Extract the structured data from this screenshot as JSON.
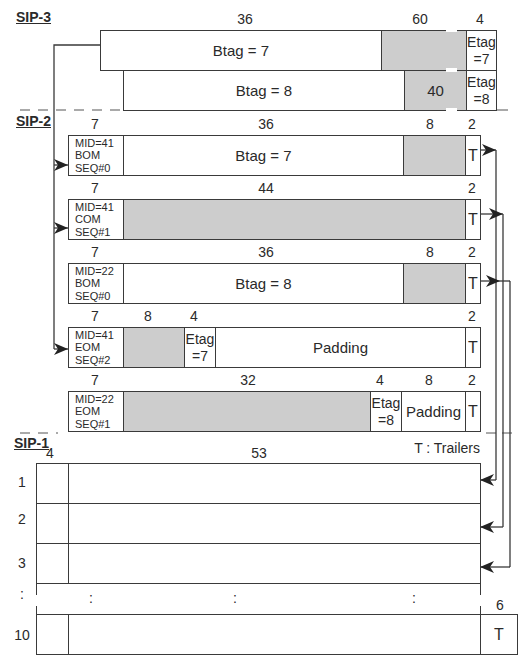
{
  "sections": {
    "sip3": "SIP-3",
    "sip2": "SIP-2",
    "sip1": "SIP-1"
  },
  "sip3": {
    "rows": [
      {
        "btag": "Btag = 7",
        "payload_width": "36",
        "grey_width": "60",
        "grey_label": "",
        "etag_width": "4",
        "etag_line1": "Etag",
        "etag_line2": "=7"
      },
      {
        "btag": "Btag = 8",
        "payload_width": "",
        "grey_width": "",
        "grey_label": "40",
        "etag_width": "",
        "etag_line1": "Etag",
        "etag_line2": "=8"
      }
    ]
  },
  "sip2": {
    "rows": [
      {
        "hdr_w": "7",
        "mid": "MID=41",
        "type": "BOM",
        "seq": "SEQ#0",
        "w1": "36",
        "text1": "Btag = 7",
        "w2": "8",
        "trailer_w": "2",
        "trailer": "T"
      },
      {
        "hdr_w": "7",
        "mid": "MID=41",
        "type": "COM",
        "seq": "SEQ#1",
        "w1": "44",
        "trailer_w": "2",
        "trailer": "T"
      },
      {
        "hdr_w": "7",
        "mid": "MID=22",
        "type": "BOM",
        "seq": "SEQ#0",
        "w1": "36",
        "text1": "Btag = 8",
        "w2": "8",
        "trailer_w": "2",
        "trailer": "T"
      },
      {
        "hdr_w": "7",
        "mid": "MID=41",
        "type": "EOM",
        "seq": "SEQ#2",
        "w1": "8",
        "w2": "4",
        "etag_line1": "Etag",
        "etag_line2": "=7",
        "padding": "Padding",
        "trailer_w": "2",
        "trailer": "T"
      },
      {
        "hdr_w": "7",
        "mid": "MID=22",
        "type": "EOM",
        "seq": "SEQ#1",
        "w1": "32",
        "w2": "4",
        "etag_line1": "Etag",
        "etag_line2": "=8",
        "w3": "8",
        "padding": "Padding",
        "trailer_w": "2",
        "trailer": "T"
      }
    ],
    "legend": "T : Trailers"
  },
  "sip1": {
    "header_width": "4",
    "payload_width": "53",
    "trailer_width": "6",
    "trailer": "T",
    "row_numbers": [
      "1",
      "2",
      "3",
      ":",
      "10"
    ],
    "ellipsis": ":"
  },
  "colors": {
    "line": "#3a3a3a",
    "shaded": "#cdcdcd",
    "background": "#ffffff"
  }
}
